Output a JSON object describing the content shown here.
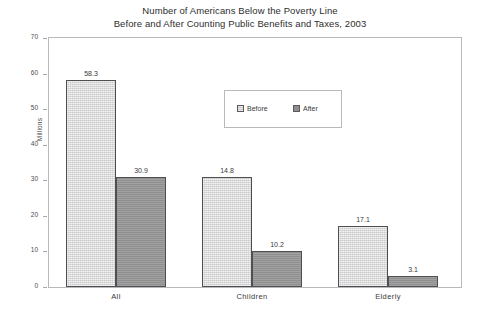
{
  "chart_data": {
    "type": "bar",
    "title": "Number of Americans Below the Poverty Line\nBefore and After Counting Public Benefits and Taxes, 2003",
    "title_line1": "Number of Americans Below the Poverty Line",
    "title_line2": "Before and After Counting Public Benefits and Taxes, 2003",
    "categories": [
      "All",
      "Children",
      "Elderly"
    ],
    "series": [
      {
        "name": "Before",
        "values": [
          58.3,
          30.9,
          17.1
        ],
        "color": "#c9c9c9"
      },
      {
        "name": "After",
        "values": [
          30.9,
          10.2,
          3.1
        ],
        "color": "#8e8e8e"
      }
    ],
    "xlabel": "",
    "ylabel": "Millions",
    "ylim": [
      0,
      70
    ],
    "ytick_step": 10,
    "yticks": [
      0,
      10,
      20,
      30,
      40,
      50,
      60,
      70
    ],
    "ytick_labels": [
      "0",
      "10",
      "20",
      "30",
      "40",
      "50",
      "60",
      "70"
    ],
    "grid": false,
    "legend_position": "upper center",
    "legend_entries": [
      "Before",
      "After"
    ],
    "data_labels": [
      {
        "category": "All",
        "series": "Before",
        "label": "58.3"
      },
      {
        "category": "All",
        "series": "After",
        "label": "30.9"
      },
      {
        "category": "Children",
        "series": "Before",
        "label": "14.8"
      },
      {
        "category": "Children",
        "series": "After",
        "label": "10.2"
      },
      {
        "category": "Elderly",
        "series": "Before",
        "label": "17.1"
      },
      {
        "category": "Elderly",
        "series": "After",
        "label": "3.1"
      }
    ],
    "note_values_shown": {
      "All": {
        "Before": 58.3,
        "After": 30.9
      },
      "Children": {
        "Before": 14.8,
        "After": 10.2
      },
      "Elderly": {
        "Before": 17.1,
        "After": 3.1
      }
    },
    "plot_background": "#ffffff",
    "frame_color": "#b9b9bd"
  }
}
